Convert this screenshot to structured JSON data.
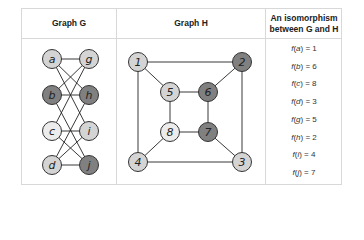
{
  "headers": {
    "graph_g": "Graph G",
    "graph_h": "Graph H",
    "iso_line1": "An isomorphism",
    "iso_line2": "between G and H"
  },
  "colors": {
    "light": "#d4d4d4",
    "lighter": "#ececec",
    "dark": "#808080",
    "border": "#d8d8d8",
    "edge": "#222222"
  },
  "graph_g": {
    "nodes": [
      {
        "id": "a",
        "x": 52,
        "y": 59,
        "fill": "light"
      },
      {
        "id": "g",
        "x": 89,
        "y": 59,
        "fill": "light"
      },
      {
        "id": "b",
        "x": 52,
        "y": 95,
        "fill": "dark"
      },
      {
        "id": "h",
        "x": 89,
        "y": 95,
        "fill": "dark"
      },
      {
        "id": "c",
        "x": 52,
        "y": 131,
        "fill": "lighter"
      },
      {
        "id": "i",
        "x": 89,
        "y": 131,
        "fill": "light"
      },
      {
        "id": "d",
        "x": 52,
        "y": 165,
        "fill": "light"
      },
      {
        "id": "j",
        "x": 89,
        "y": 165,
        "fill": "dark"
      }
    ],
    "edges": [
      [
        "a",
        "g"
      ],
      [
        "a",
        "h"
      ],
      [
        "a",
        "i"
      ],
      [
        "b",
        "g"
      ],
      [
        "b",
        "h"
      ],
      [
        "b",
        "j"
      ],
      [
        "c",
        "g"
      ],
      [
        "c",
        "i"
      ],
      [
        "c",
        "j"
      ],
      [
        "d",
        "h"
      ],
      [
        "d",
        "i"
      ],
      [
        "d",
        "j"
      ]
    ]
  },
  "graph_h": {
    "nodes": [
      {
        "id": "1",
        "x": 138,
        "y": 62,
        "fill": "light"
      },
      {
        "id": "2",
        "x": 242,
        "y": 62,
        "fill": "dark"
      },
      {
        "id": "5",
        "x": 170,
        "y": 92,
        "fill": "light"
      },
      {
        "id": "6",
        "x": 208,
        "y": 92,
        "fill": "dark"
      },
      {
        "id": "8",
        "x": 170,
        "y": 132,
        "fill": "lighter"
      },
      {
        "id": "7",
        "x": 208,
        "y": 132,
        "fill": "dark"
      },
      {
        "id": "4",
        "x": 138,
        "y": 162,
        "fill": "light"
      },
      {
        "id": "3",
        "x": 242,
        "y": 162,
        "fill": "light"
      }
    ],
    "edges": [
      [
        "1",
        "2"
      ],
      [
        "2",
        "3"
      ],
      [
        "3",
        "4"
      ],
      [
        "4",
        "1"
      ],
      [
        "5",
        "6"
      ],
      [
        "6",
        "7"
      ],
      [
        "7",
        "8"
      ],
      [
        "8",
        "5"
      ],
      [
        "1",
        "5"
      ],
      [
        "2",
        "6"
      ],
      [
        "3",
        "7"
      ],
      [
        "4",
        "8"
      ]
    ]
  },
  "isomorphism": [
    {
      "fn": "f(",
      "var": "a",
      "rest": ") = 1"
    },
    {
      "fn": "f(",
      "var": "b",
      "rest": ") = 6"
    },
    {
      "fn": "f(",
      "var": "c",
      "rest": ") = 8"
    },
    {
      "fn": "f(",
      "var": "d",
      "rest": ") = 3"
    },
    {
      "fn": "f(",
      "var": "g",
      "rest": ") = 5"
    },
    {
      "fn": "f(",
      "var": "h",
      "rest": ") = 2"
    },
    {
      "fn": "f(",
      "var": "i",
      "rest": ") = 4"
    },
    {
      "fn": "f(",
      "var": "j",
      "rest": ") = 7"
    }
  ]
}
